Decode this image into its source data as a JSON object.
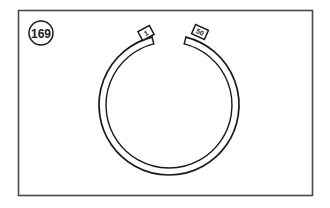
{
  "figure": {
    "type": "technical-parts-illustration",
    "background_color": "#ffffff",
    "line_color": "#1a1a1a",
    "frame": {
      "stroke_color": "#4a4a4a",
      "fill_color": "#ffffff",
      "x": 18,
      "y": 10,
      "width": 295,
      "height": 186
    },
    "callout": {
      "label": "169",
      "shape": "circle",
      "center_x": 41,
      "center_y": 33,
      "radius": 12,
      "stroke_color": "#1a1a1a"
    },
    "ring": {
      "name": "snap-ring",
      "center_x": 169,
      "center_y": 105,
      "outer_radius": 70,
      "band_thickness": 7,
      "gap_top": true,
      "gap_start_angle_deg": -76,
      "gap_end_angle_deg": -104,
      "stroke_color": "#1a1a1a"
    },
    "end_tags": [
      {
        "id": "left-end-tag",
        "label": "1",
        "center_x": 146,
        "center_y": 33,
        "width": 13,
        "height": 10,
        "rotation_deg": -28,
        "stroke_color": "#1a1a1a"
      },
      {
        "id": "right-end-tag",
        "label": "50",
        "center_x": 200,
        "center_y": 32,
        "width": 14,
        "height": 10,
        "rotation_deg": 24,
        "stroke_color": "#1a1a1a"
      }
    ]
  }
}
